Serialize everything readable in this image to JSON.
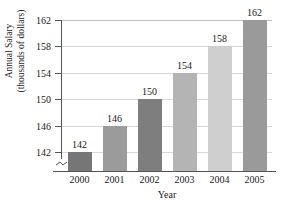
{
  "chart_data": {
    "type": "bar",
    "title": "",
    "xlabel": "Year",
    "ylabel_line1": "Annual Salary",
    "ylabel_line2": "(thousands of dollars)",
    "categories": [
      "2000",
      "2001",
      "2002",
      "2003",
      "2004",
      "2005"
    ],
    "values": [
      142,
      146,
      150,
      154,
      158,
      162
    ],
    "data_labels": [
      "142",
      "146",
      "150",
      "154",
      "158",
      "162"
    ],
    "ylim": [
      142,
      162
    ],
    "yticks": [
      142,
      146,
      150,
      154,
      158,
      162
    ],
    "ytick_labels": [
      "142",
      "146",
      "150",
      "154",
      "158",
      "162"
    ],
    "axis_break": true,
    "grid": "horizontal",
    "legend": "none",
    "bar_colors": [
      "#767676",
      "#9b9b9b",
      "#7e7e7e",
      "#b4b4b4",
      "#cfcfcf",
      "#9a9a9a"
    ],
    "grid_color": "#d8d8d8",
    "axis_color": "#555555",
    "text_color": "#1a1a1a"
  }
}
